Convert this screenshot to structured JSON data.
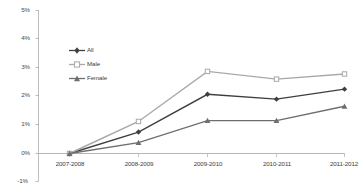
{
  "figure": {
    "clipped_title_fragment": "",
    "background_color": "#ffffff"
  },
  "chart_data": {
    "type": "line",
    "title": "",
    "xlabel": "",
    "ylabel": "",
    "categories": [
      "2007-2008",
      "2008-2009",
      "2009-2010",
      "2010-2011",
      "2011-2012"
    ],
    "ylim": [
      -1,
      5
    ],
    "yticks": [
      5,
      4,
      3,
      2,
      1,
      0,
      -1
    ],
    "ytick_labels": [
      "5%",
      "4%",
      "3%",
      "2%",
      "1%",
      "0%",
      "-1%"
    ],
    "grid": false,
    "legend_position": "upper-left-inside",
    "series": [
      {
        "name": "All",
        "color": "#3f3f3f",
        "marker": "diamond-filled",
        "values": [
          0,
          0.75,
          2.07,
          1.9,
          2.25
        ]
      },
      {
        "name": "Male",
        "color": "#a8a8a8",
        "marker": "square-open",
        "values": [
          0,
          1.12,
          2.87,
          2.6,
          2.78
        ]
      },
      {
        "name": "Female",
        "color": "#6e6e6e",
        "marker": "triangle-filled",
        "values": [
          0,
          0.38,
          1.15,
          1.15,
          1.65
        ]
      }
    ]
  },
  "axes": {
    "y_axis_line_color": "#bdbdbd",
    "zero_line_color": "#b5b5b5"
  }
}
